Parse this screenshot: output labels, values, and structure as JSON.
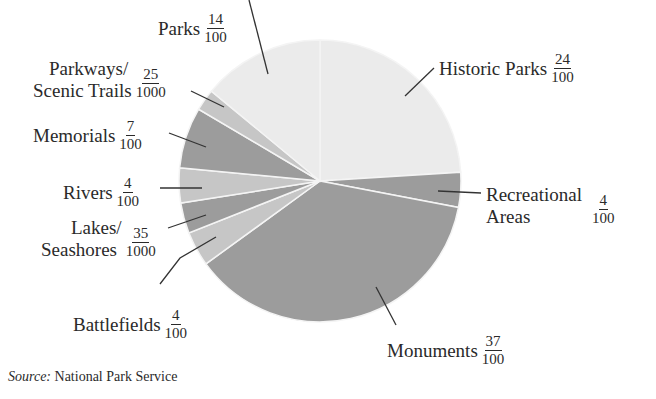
{
  "chart_data": {
    "type": "pie",
    "title": "",
    "start_angle": "12 o'clock, clockwise",
    "slices": [
      {
        "label": "Historic Parks",
        "numerator": "24",
        "denominator": "100",
        "value": 0.24,
        "color": "#ebebeb"
      },
      {
        "label": "Recreational Areas",
        "numerator": "4",
        "denominator": "100",
        "value": 0.04,
        "color": "#9c9c9c"
      },
      {
        "label": "Monuments",
        "numerator": "37",
        "denominator": "100",
        "value": 0.37,
        "color": "#9c9c9c"
      },
      {
        "label": "Battlefields",
        "numerator": "4",
        "denominator": "100",
        "value": 0.04,
        "color": "#c6c6c6"
      },
      {
        "label": "Lakes/ Seashores",
        "numerator": "35",
        "denominator": "1000",
        "value": 0.035,
        "color": "#9c9c9c"
      },
      {
        "label": "Rivers",
        "numerator": "4",
        "denominator": "100",
        "value": 0.04,
        "color": "#c6c6c6"
      },
      {
        "label": "Memorials",
        "numerator": "7",
        "denominator": "100",
        "value": 0.07,
        "color": "#9c9c9c"
      },
      {
        "label": "Parkways/ Scenic Trails",
        "numerator": "25",
        "denominator": "1000",
        "value": 0.025,
        "color": "#c6c6c6"
      },
      {
        "label": "Parks",
        "numerator": "14",
        "denominator": "100",
        "value": 0.14,
        "color": "#ebebeb"
      }
    ],
    "source_prefix": "Source:",
    "source_text": "National Park Service"
  },
  "labels": {
    "parks": {
      "name": "Parks",
      "num": "14",
      "den": "100"
    },
    "parkways": {
      "line1": "Parkways/",
      "line2": "Scenic Trails",
      "num": "25",
      "den": "1000"
    },
    "memorials": {
      "name": "Memorials",
      "num": "7",
      "den": "100"
    },
    "rivers": {
      "name": "Rivers",
      "num": "4",
      "den": "100"
    },
    "lakes": {
      "line1": "Lakes/",
      "line2": "Seashores",
      "num": "35",
      "den": "1000"
    },
    "battlefields": {
      "name": "Battlefields",
      "num": "4",
      "den": "100"
    },
    "historic": {
      "name": "Historic Parks",
      "num": "24",
      "den": "100"
    },
    "recreational": {
      "line1": "Recreational",
      "line2": "Areas",
      "num": "4",
      "den": "100"
    },
    "monuments": {
      "name": "Monuments",
      "num": "37",
      "den": "100"
    }
  },
  "source": {
    "prefix": "Source:",
    "text": "National Park Service"
  }
}
